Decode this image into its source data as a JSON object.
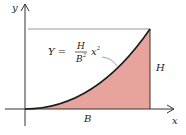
{
  "diagram": {
    "axes": {
      "x_label": "x",
      "y_label": "y"
    },
    "equation": {
      "lhs": "Y =",
      "numerator": "H",
      "denominator": "B",
      "denominator_exp": "2",
      "variable": "x",
      "variable_exp": "2"
    },
    "labels": {
      "height": "H",
      "base": "B"
    },
    "colors": {
      "fill": "#e8a49c",
      "curve": "#1a1a1a",
      "axis": "#333333",
      "guide": "#9a9a9a"
    }
  }
}
